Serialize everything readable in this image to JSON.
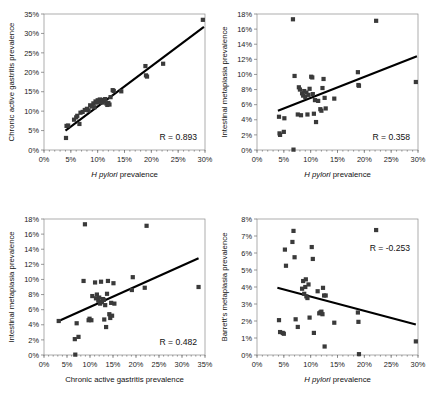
{
  "figure": {
    "title": "",
    "panel_count": 4,
    "marker_color": "#3a3a3a",
    "trendline_color": "#000000",
    "axis_color": "#6e6e6e"
  },
  "chart_data": [
    {
      "id": "panel-tl",
      "type": "scatter",
      "title": "",
      "xlabel": "H pylori prevalence",
      "xlabel_italic_prefix": "H pylori",
      "ylabel": "Chronic active gastritis prevalence",
      "xlim": [
        0,
        30
      ],
      "ylim": [
        0,
        35
      ],
      "xticks": [
        0,
        5,
        10,
        15,
        20,
        25,
        30
      ],
      "yticks": [
        0,
        5,
        10,
        15,
        20,
        25,
        30,
        35
      ],
      "xticklabels": [
        "0%",
        "5%",
        "10%",
        "15%",
        "20%",
        "25%",
        "30%"
      ],
      "yticklabels": [
        "0%",
        "5%",
        "10%",
        "15%",
        "20%",
        "25%",
        "30%",
        "35%"
      ],
      "grid": false,
      "legend": "none",
      "annotation": "R = 0.893",
      "correlation": 0.893,
      "trendline": {
        "x0": 4.0,
        "y0": 5.0,
        "x1": 29.8,
        "y1": 31.7
      },
      "points": [
        [
          4.1,
          3.1
        ],
        [
          4.2,
          6.2
        ],
        [
          4.5,
          6.3
        ],
        [
          5.6,
          7.8
        ],
        [
          6.0,
          8.4
        ],
        [
          6.2,
          8.8
        ],
        [
          6.6,
          6.7
        ],
        [
          6.8,
          9.6
        ],
        [
          7.2,
          9.8
        ],
        [
          7.6,
          10.3
        ],
        [
          8.0,
          10.6
        ],
        [
          8.3,
          10.2
        ],
        [
          8.6,
          11.5
        ],
        [
          8.9,
          11.2
        ],
        [
          9.2,
          12.0
        ],
        [
          9.4,
          11.0
        ],
        [
          9.6,
          12.5
        ],
        [
          9.8,
          12.2
        ],
        [
          10.0,
          12.8
        ],
        [
          10.2,
          12.4
        ],
        [
          10.4,
          13.0
        ],
        [
          10.6,
          12.6
        ],
        [
          10.8,
          12.2
        ],
        [
          11.0,
          12.9
        ],
        [
          11.2,
          12.5
        ],
        [
          11.4,
          13.1
        ],
        [
          11.6,
          12.0
        ],
        [
          11.8,
          11.6
        ],
        [
          12.0,
          12.1
        ],
        [
          12.2,
          11.7
        ],
        [
          12.4,
          13.6
        ],
        [
          12.8,
          15.4
        ],
        [
          13.0,
          15.2
        ],
        [
          14.4,
          15.1
        ],
        [
          18.9,
          21.6
        ],
        [
          19.0,
          19.2
        ],
        [
          19.2,
          18.9
        ],
        [
          22.2,
          22.2
        ],
        [
          29.6,
          33.5
        ]
      ]
    },
    {
      "id": "panel-tr",
      "type": "scatter",
      "title": "",
      "xlabel": "H pylori prevalence",
      "xlabel_italic_prefix": "H pylori",
      "ylabel": "Intestinal metaplasia prevalence",
      "xlim": [
        0,
        30
      ],
      "ylim": [
        0,
        18
      ],
      "xticks": [
        0,
        5,
        10,
        15,
        20,
        25,
        30
      ],
      "yticks": [
        0,
        2,
        4,
        6,
        8,
        10,
        12,
        14,
        16,
        18
      ],
      "xticklabels": [
        "0%",
        "5%",
        "10%",
        "15%",
        "20%",
        "25%",
        "30%"
      ],
      "yticklabels": [
        "0%",
        "2%",
        "4%",
        "6%",
        "8%",
        "10%",
        "12%",
        "14%",
        "16%",
        "18%"
      ],
      "grid": false,
      "legend": "none",
      "annotation": "R = 0.358",
      "correlation": 0.358,
      "trendline": {
        "x0": 3.9,
        "y0": 5.2,
        "x1": 29.8,
        "y1": 12.4
      },
      "points": [
        [
          4.1,
          4.4
        ],
        [
          4.2,
          2.2
        ],
        [
          4.3,
          2.0
        ],
        [
          5.0,
          2.4
        ],
        [
          5.1,
          4.2
        ],
        [
          6.7,
          17.3
        ],
        [
          6.8,
          0.05
        ],
        [
          7.0,
          9.8
        ],
        [
          7.6,
          4.7
        ],
        [
          7.8,
          8.3
        ],
        [
          8.0,
          8.0
        ],
        [
          8.2,
          4.6
        ],
        [
          8.4,
          7.5
        ],
        [
          8.6,
          7.2
        ],
        [
          8.8,
          7.8
        ],
        [
          9.0,
          7.0
        ],
        [
          9.2,
          7.6
        ],
        [
          9.4,
          4.7
        ],
        [
          9.6,
          7.3
        ],
        [
          9.8,
          8.1
        ],
        [
          10.1,
          9.7
        ],
        [
          10.3,
          9.6
        ],
        [
          10.4,
          7.4
        ],
        [
          10.6,
          4.8
        ],
        [
          10.8,
          6.6
        ],
        [
          11.0,
          3.7
        ],
        [
          11.4,
          6.5
        ],
        [
          11.8,
          5.4
        ],
        [
          12.0,
          5.2
        ],
        [
          12.2,
          8.2
        ],
        [
          12.4,
          9.4
        ],
        [
          12.6,
          6.9
        ],
        [
          12.8,
          5.5
        ],
        [
          14.4,
          6.8
        ],
        [
          18.8,
          10.3
        ],
        [
          18.9,
          8.6
        ],
        [
          19.0,
          8.5
        ],
        [
          22.2,
          17.1
        ],
        [
          29.6,
          9.0
        ]
      ]
    },
    {
      "id": "panel-bl",
      "type": "scatter",
      "title": "",
      "xlabel": "Chronic active gastritis prevalence",
      "xlabel_italic_prefix": "",
      "ylabel": "Intestinal metaplasia prevalence",
      "xlim": [
        0,
        35
      ],
      "ylim": [
        0,
        18
      ],
      "xticks": [
        0,
        5,
        10,
        15,
        20,
        25,
        30,
        35
      ],
      "yticks": [
        0,
        2,
        4,
        6,
        8,
        10,
        12,
        14,
        16,
        18
      ],
      "xticklabels": [
        "0%",
        "5%",
        "10%",
        "15%",
        "20%",
        "25%",
        "30%",
        "35%"
      ],
      "yticklabels": [
        "0%",
        "2%",
        "4%",
        "6%",
        "8%",
        "10%",
        "12%",
        "14%",
        "16%",
        "18%"
      ],
      "grid": false,
      "legend": "none",
      "annotation": "R = 0.482",
      "correlation": 0.482,
      "trendline": {
        "x0": 3.2,
        "y0": 4.5,
        "x1": 33.6,
        "y1": 12.8
      },
      "points": [
        [
          3.2,
          4.5
        ],
        [
          6.7,
          2.1
        ],
        [
          6.8,
          0.05
        ],
        [
          7.1,
          4.2
        ],
        [
          7.5,
          2.4
        ],
        [
          8.6,
          9.8
        ],
        [
          9.7,
          4.6
        ],
        [
          9.9,
          4.8
        ],
        [
          10.3,
          4.6
        ],
        [
          10.5,
          7.8
        ],
        [
          11.1,
          9.6
        ],
        [
          11.3,
          7.5
        ],
        [
          11.5,
          8.0
        ],
        [
          11.8,
          7.2
        ],
        [
          12.0,
          7.6
        ],
        [
          12.2,
          6.8
        ],
        [
          12.4,
          9.7
        ],
        [
          12.6,
          7.0
        ],
        [
          12.8,
          7.4
        ],
        [
          13.0,
          7.3
        ],
        [
          13.1,
          4.7
        ],
        [
          13.3,
          6.6
        ],
        [
          13.5,
          3.7
        ],
        [
          13.7,
          8.1
        ],
        [
          13.9,
          9.8
        ],
        [
          14.2,
          5.4
        ],
        [
          14.4,
          4.9
        ],
        [
          14.6,
          6.9
        ],
        [
          14.8,
          5.2
        ],
        [
          15.1,
          9.5
        ],
        [
          15.3,
          6.8
        ],
        [
          19.1,
          8.6
        ],
        [
          19.3,
          10.3
        ],
        [
          21.9,
          8.9
        ],
        [
          22.3,
          17.1
        ],
        [
          8.9,
          17.3
        ],
        [
          33.6,
          9.0
        ]
      ]
    },
    {
      "id": "panel-br",
      "type": "scatter",
      "title": "",
      "xlabel": "H pylori prevalence",
      "xlabel_italic_prefix": "H pylori",
      "ylabel": "Barrett's metaplasia prevalence",
      "xlim": [
        0,
        30
      ],
      "ylim": [
        0,
        8
      ],
      "xticks": [
        0,
        5,
        10,
        15,
        20,
        25,
        30
      ],
      "yticks": [
        0,
        1,
        2,
        3,
        4,
        5,
        6,
        7,
        8
      ],
      "xticklabels": [
        "0%",
        "5%",
        "10%",
        "15%",
        "20%",
        "25%",
        "30%"
      ],
      "yticklabels": [
        "0%",
        "1%",
        "2%",
        "3%",
        "4%",
        "5%",
        "6%",
        "7%",
        "8%"
      ],
      "grid": false,
      "legend": "none",
      "annotation": "R = -0.253",
      "correlation": -0.253,
      "trendline": {
        "x0": 3.8,
        "y0": 3.95,
        "x1": 29.6,
        "y1": 1.8
      },
      "points": [
        [
          4.1,
          2.05
        ],
        [
          4.3,
          1.35
        ],
        [
          4.8,
          1.3
        ],
        [
          5.0,
          1.25
        ],
        [
          5.2,
          6.2
        ],
        [
          5.4,
          5.25
        ],
        [
          6.6,
          6.65
        ],
        [
          6.8,
          7.3
        ],
        [
          7.0,
          5.75
        ],
        [
          7.2,
          2.1
        ],
        [
          7.6,
          1.65
        ],
        [
          8.4,
          3.9
        ],
        [
          8.6,
          4.35
        ],
        [
          8.8,
          3.6
        ],
        [
          9.0,
          4.0
        ],
        [
          9.1,
          4.45
        ],
        [
          9.2,
          3.45
        ],
        [
          9.4,
          3.35
        ],
        [
          9.6,
          4.15
        ],
        [
          9.8,
          2.2
        ],
        [
          10.2,
          6.35
        ],
        [
          10.4,
          5.65
        ],
        [
          10.6,
          1.3
        ],
        [
          11.3,
          3.75
        ],
        [
          11.6,
          2.45
        ],
        [
          11.8,
          2.5
        ],
        [
          12.0,
          2.55
        ],
        [
          12.2,
          2.4
        ],
        [
          12.3,
          3.95
        ],
        [
          12.5,
          3.5
        ],
        [
          12.6,
          0.5
        ],
        [
          12.8,
          3.5
        ],
        [
          14.4,
          1.9
        ],
        [
          18.8,
          2.5
        ],
        [
          18.9,
          1.95
        ],
        [
          19.0,
          0.05
        ],
        [
          22.2,
          7.35
        ],
        [
          29.6,
          0.8
        ]
      ]
    }
  ]
}
